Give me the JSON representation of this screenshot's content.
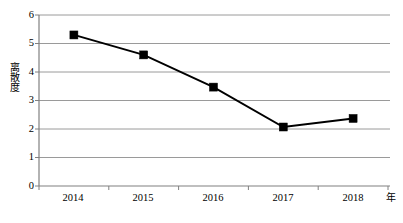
{
  "chart_data": {
    "type": "line",
    "title": "",
    "xlabel": "年",
    "ylabel": "离散度",
    "categories": [
      "2014",
      "2015",
      "2016",
      "2017",
      "2018"
    ],
    "values": [
      5.3,
      4.6,
      3.47,
      2.07,
      2.37
    ],
    "series": [
      {
        "name": "离散度",
        "values": [
          5.3,
          4.6,
          3.47,
          2.07,
          2.37
        ]
      }
    ],
    "ylim": [
      0,
      6
    ],
    "y_ticks": [
      "0",
      "1",
      "2",
      "3",
      "4",
      "5",
      "6"
    ],
    "grid": true,
    "grid_axis": "y",
    "legend": "none",
    "marker": "filled-square",
    "line_color": "#000000",
    "marker_color": "#000000",
    "grid_color": "#9a9a9a",
    "axis_color": "#808080",
    "background": "#ffffff"
  },
  "axis": {
    "y_title": "离散度",
    "x_unit": "年"
  }
}
